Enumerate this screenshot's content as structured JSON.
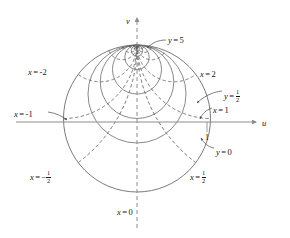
{
  "figure": {
    "axes": {
      "horizontal_label": "u",
      "vertical_label": "v",
      "tick_label": "1"
    },
    "colors": {
      "solid_curve": "#6b6b6b",
      "dashed_curve": "#5a5a5a",
      "axis": "#8d8d8d",
      "text": "#141414"
    },
    "labels": [
      {
        "name": "y-5",
        "text": "y = 5",
        "var": "y",
        "value": "5",
        "x": 168,
        "y": 36,
        "style": "plain"
      },
      {
        "name": "x-2",
        "text": "x = 2",
        "var": "x",
        "value": "2",
        "x": 200,
        "y": 70,
        "style": "plain"
      },
      {
        "name": "y-half",
        "text": "y = 1/2",
        "var": "y",
        "value": "1/2",
        "x": 224,
        "y": 89,
        "style": "frac"
      },
      {
        "name": "x-1",
        "text": "x = 1",
        "var": "x",
        "value": "1",
        "x": 213,
        "y": 106,
        "style": "plain"
      },
      {
        "name": "y-0",
        "text": "y = 0",
        "var": "y",
        "value": "0",
        "x": 216,
        "y": 148,
        "style": "plain"
      },
      {
        "name": "x-half",
        "text": "x = 1/2",
        "var": "x",
        "value": "1/2",
        "x": 190,
        "y": 170,
        "style": "frac"
      },
      {
        "name": "x-minus-2",
        "text": "x = -2",
        "var": "x",
        "value": "-2",
        "x": 28,
        "y": 68,
        "style": "plain"
      },
      {
        "name": "x-minus-1",
        "text": "x = -1",
        "var": "x",
        "value": "-1",
        "x": 14,
        "y": 110,
        "style": "plain"
      },
      {
        "name": "x-minus-half",
        "text": "x = -1/2",
        "var": "x",
        "value": "-1/2",
        "x": 30,
        "y": 170,
        "style": "frac"
      },
      {
        "name": "x-0",
        "text": "x = 0",
        "var": "x",
        "value": "0",
        "x": 117,
        "y": 208,
        "style": "plain"
      }
    ]
  },
  "chart_data": {
    "type": "line",
    "xlabel": "u",
    "ylabel": "v",
    "xlim": [
      -2.0,
      2.0
    ],
    "ylim": [
      -1.45,
      1.45
    ],
    "grid": false,
    "legend": "none",
    "tick_labels": {
      "x": [
        "1"
      ],
      "y": []
    },
    "unit_circle": {
      "center": [
        0,
        0
      ],
      "radius": 1,
      "style": "solid",
      "label": "y = 0"
    },
    "tangent_point": [
      0,
      1
    ],
    "series": [
      {
        "name": "y = 0",
        "style": "solid",
        "family": "y-const",
        "param": 0,
        "circle_center": [
          0,
          0
        ],
        "circle_radius": 1.0
      },
      {
        "name": "y = 1/2",
        "style": "solid",
        "family": "y-const",
        "param": 0.5,
        "circle_center": [
          0,
          0.3333
        ],
        "circle_radius": 0.6667
      },
      {
        "name": "y = 1",
        "style": "solid",
        "family": "y-const",
        "param": 1,
        "circle_center": [
          0,
          0.5
        ],
        "circle_radius": 0.5
      },
      {
        "name": "y = 2",
        "style": "solid",
        "family": "y-const",
        "param": 2,
        "circle_center": [
          0,
          0.6667
        ],
        "circle_radius": 0.3333
      },
      {
        "name": "y = 5",
        "style": "solid",
        "family": "y-const",
        "param": 5,
        "circle_center": [
          0,
          0.8333
        ],
        "circle_radius": 0.1667
      },
      {
        "name": "y = 12",
        "style": "solid",
        "family": "y-const",
        "param": 12,
        "circle_center": [
          0,
          0.9231
        ],
        "circle_radius": 0.0769
      },
      {
        "name": "x = 0",
        "style": "dashed",
        "family": "x-const",
        "param": 0,
        "line": "u = 0"
      },
      {
        "name": "x = 1/2",
        "style": "dashed",
        "family": "x-const",
        "param": 0.5,
        "circle_center": [
          2,
          1
        ],
        "circle_radius": 2.0
      },
      {
        "name": "x = 1",
        "style": "dashed",
        "family": "x-const",
        "param": 1,
        "circle_center": [
          1,
          1
        ],
        "circle_radius": 1.0
      },
      {
        "name": "x = 2",
        "style": "dashed",
        "family": "x-const",
        "param": 2,
        "circle_center": [
          0.5,
          1
        ],
        "circle_radius": 0.5
      },
      {
        "name": "x = 5",
        "style": "dashed",
        "family": "x-const",
        "param": 5,
        "circle_center": [
          0.2,
          1
        ],
        "circle_radius": 0.2
      },
      {
        "name": "x = -1/2",
        "style": "dashed",
        "family": "x-const",
        "param": -0.5,
        "circle_center": [
          -2,
          1
        ],
        "circle_radius": 2.0
      },
      {
        "name": "x = -1",
        "style": "dashed",
        "family": "x-const",
        "param": -1,
        "circle_center": [
          -1,
          1
        ],
        "circle_radius": 1.0
      },
      {
        "name": "x = -2",
        "style": "dashed",
        "family": "x-const",
        "param": -2,
        "circle_center": [
          -0.5,
          1
        ],
        "circle_radius": 0.5
      },
      {
        "name": "x = -5",
        "style": "dashed",
        "family": "x-const",
        "param": -5,
        "circle_center": [
          -0.2,
          1
        ],
        "circle_radius": 0.2
      }
    ],
    "annotations": [
      {
        "text": "y = 5",
        "target": [
          0.1,
          0.93
        ]
      },
      {
        "text": "x = 2",
        "target": [
          0.78,
          0.62
        ]
      },
      {
        "text": "y = 1/2",
        "target": [
          0.93,
          0.27
        ]
      },
      {
        "text": "x = 1",
        "target": [
          0.96,
          0.05
        ]
      },
      {
        "text": "y = 0",
        "target": [
          0.93,
          -0.36
        ]
      },
      {
        "text": "x = 1/2",
        "target": [
          0.7,
          -0.7
        ]
      },
      {
        "text": "x = -2",
        "target": [
          -0.78,
          0.62
        ]
      },
      {
        "text": "x = -1",
        "target": [
          -0.96,
          0.05
        ]
      },
      {
        "text": "x = -1/2",
        "target": [
          -0.7,
          -0.7
        ]
      },
      {
        "text": "x = 0",
        "target": [
          0,
          -1.0
        ]
      }
    ]
  }
}
